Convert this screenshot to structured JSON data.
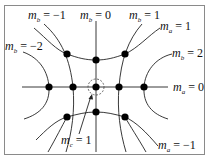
{
  "diagram": {
    "title": "",
    "colors": {
      "line": "#222222",
      "dot": "#000000",
      "frame": "#777777",
      "dashed": "#444444"
    },
    "frame": {
      "x": 4,
      "y": 5,
      "w": 201,
      "h": 150
    },
    "axes": {
      "horizontal": {
        "x1": 22,
        "y": 87,
        "x2": 168
      },
      "vertical": {
        "x": 96,
        "y1": 20,
        "y2": 152
      }
    },
    "nodes": [
      {
        "id": "n1",
        "x": 67,
        "y": 54
      },
      {
        "id": "n2",
        "x": 96,
        "y": 60
      },
      {
        "id": "n3",
        "x": 125,
        "y": 54
      },
      {
        "id": "n4",
        "x": 49,
        "y": 87
      },
      {
        "id": "n5",
        "x": 73,
        "y": 87
      },
      {
        "id": "n6",
        "x": 96,
        "y": 87
      },
      {
        "id": "n7",
        "x": 119,
        "y": 87
      },
      {
        "id": "n8",
        "x": 144,
        "y": 87
      },
      {
        "id": "n9",
        "x": 67,
        "y": 117
      },
      {
        "id": "n10",
        "x": 96,
        "y": 112
      },
      {
        "id": "n11",
        "x": 125,
        "y": 117
      }
    ],
    "highlight": {
      "x": 96,
      "y": 87,
      "r": 8,
      "style": "dashed"
    },
    "labels": {
      "mb_neg1": {
        "var": "m",
        "sub": "b",
        "eq": " = −1"
      },
      "mb_0": {
        "var": "m",
        "sub": "b",
        "eq": " = 0"
      },
      "mb_1": {
        "var": "m",
        "sub": "b",
        "eq": " = 1"
      },
      "ma_1": {
        "var": "m",
        "sub": "a",
        "eq": " = 1"
      },
      "mb_neg2": {
        "var": "m",
        "sub": "b",
        "eq": " = −2"
      },
      "mb_2": {
        "var": "m",
        "sub": "b",
        "eq": " = 2"
      },
      "ma_0": {
        "var": "m",
        "sub": "a",
        "eq": " = 0"
      },
      "mc_1": {
        "var": "m",
        "sub": "c",
        "eq": " = 1"
      },
      "ma_neg1": {
        "var": "m",
        "sub": "a",
        "eq": " = −1"
      }
    }
  }
}
